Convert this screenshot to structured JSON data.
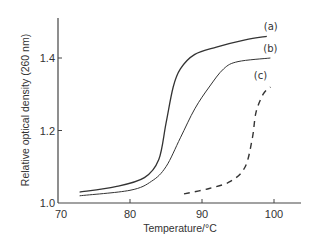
{
  "chart_data": {
    "type": "line",
    "title": "",
    "xlabel": "Temperature/°C",
    "ylabel": "Relative optical density (260 nm)",
    "xlim": [
      70,
      104
    ],
    "ylim": [
      1.0,
      1.52
    ],
    "xticks": [
      70,
      80,
      90,
      100
    ],
    "xtick_labels": [
      "70",
      "80",
      "90",
      "100"
    ],
    "yticks": [
      1.0,
      1.2,
      1.4
    ],
    "ytick_labels": [
      "1.0",
      "1.2",
      "1.4"
    ],
    "grid": false,
    "legend": "inline labels at curve ends",
    "series": [
      {
        "name": "(a)",
        "style": "solid",
        "x": [
          73,
          78,
          82,
          84,
          85,
          86,
          87,
          89,
          92,
          96,
          99
        ],
        "y": [
          1.03,
          1.045,
          1.07,
          1.12,
          1.22,
          1.32,
          1.37,
          1.41,
          1.43,
          1.45,
          1.46
        ]
      },
      {
        "name": "(b)",
        "style": "solid",
        "x": [
          73,
          80,
          83,
          85,
          87,
          89,
          91,
          93,
          95,
          99.5
        ],
        "y": [
          1.02,
          1.035,
          1.06,
          1.1,
          1.18,
          1.26,
          1.32,
          1.37,
          1.39,
          1.4
        ]
      },
      {
        "name": "(c)",
        "style": "dashed",
        "x": [
          87.5,
          91,
          94,
          96,
          97,
          97.5,
          98.5,
          99.5
        ],
        "y": [
          1.025,
          1.04,
          1.06,
          1.1,
          1.18,
          1.25,
          1.3,
          1.32
        ]
      }
    ]
  },
  "colors": {
    "line": "#333333",
    "axis": "#444444",
    "background": "#ffffff"
  }
}
